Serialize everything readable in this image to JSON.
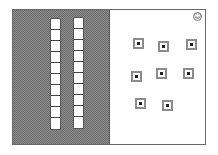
{
  "board": {
    "left_panel": {
      "rods": [
        {
          "id": "rod-1",
          "cells": 10
        },
        {
          "id": "rod-2",
          "cells": 10
        }
      ]
    },
    "right_panel": {
      "smiley_glyph": "☺",
      "units": [
        {
          "x": 23,
          "y": 28
        },
        {
          "x": 48,
          "y": 31
        },
        {
          "x": 76,
          "y": 29
        },
        {
          "x": 21,
          "y": 61
        },
        {
          "x": 46,
          "y": 58
        },
        {
          "x": 73,
          "y": 58
        },
        {
          "x": 25,
          "y": 88
        },
        {
          "x": 52,
          "y": 90
        }
      ]
    },
    "colors": {
      "panel_border": "#6a6a6a",
      "hatch_dark": "#6e6e6e",
      "hatch_light": "#8a8a8a",
      "unit_frame": "#8c8c8c"
    }
  }
}
